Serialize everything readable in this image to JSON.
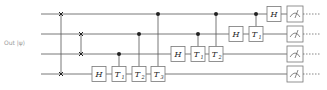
{
  "diagram": {
    "type": "quantum-circuit",
    "input_label": "Out |ψ⟩",
    "colors": {
      "wire": "#555555",
      "gate_border": "#777777",
      "gate_fill": "#ffffff",
      "control": "#222222",
      "text": "#222222"
    },
    "qubits": 4,
    "wire_y": [
      14,
      34,
      54,
      74
    ],
    "wire_x_start": 41,
    "wire_x_end": 290,
    "swaps": [
      {
        "x": 61,
        "q1": 0,
        "q2": 3
      },
      {
        "x": 81,
        "q1": 1,
        "q2": 2
      }
    ],
    "gates": [
      {
        "label": "H",
        "sub": "",
        "qubit": 3,
        "x": 99
      },
      {
        "label": "T",
        "sub": "1",
        "qubit": 3,
        "x": 119,
        "control": 2
      },
      {
        "label": "T",
        "sub": "2",
        "qubit": 3,
        "x": 139,
        "control": 1
      },
      {
        "label": "T",
        "sub": "3",
        "qubit": 3,
        "x": 158,
        "control": 0
      },
      {
        "label": "H",
        "sub": "",
        "qubit": 2,
        "x": 178
      },
      {
        "label": "T",
        "sub": "1",
        "qubit": 2,
        "x": 198,
        "control": 1
      },
      {
        "label": "T",
        "sub": "2",
        "qubit": 2,
        "x": 216,
        "control": 0
      },
      {
        "label": "H",
        "sub": "",
        "qubit": 1,
        "x": 236
      },
      {
        "label": "T",
        "sub": "1",
        "qubit": 1,
        "x": 256,
        "control": 0
      },
      {
        "label": "H",
        "sub": "",
        "qubit": 0,
        "x": 274
      }
    ],
    "measurements": {
      "x": 295,
      "qubits": [
        0,
        1,
        2,
        3
      ],
      "dashed_end": 320
    }
  }
}
